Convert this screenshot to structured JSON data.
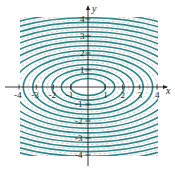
{
  "diagram": {
    "type": "contour-plot",
    "x_axis_label": "x",
    "y_axis_label": "y",
    "x_ticks": [
      "-4",
      "-3",
      "-2",
      "-1",
      "1",
      "2",
      "3",
      "4"
    ],
    "y_ticks": [
      "4",
      "3",
      "2",
      "1",
      "-1",
      "-2",
      "-3",
      "-4"
    ],
    "colors": {
      "primary_curve": "#2e8a8a",
      "secondary_curve": "#b8c8cc",
      "tertiary_curve": "#e0b8c0",
      "axis": "#222222"
    },
    "xlim": [
      -4,
      4
    ],
    "ylim": [
      -4,
      4
    ],
    "ellipse_ratio": "x-radius = 2 × y-radius"
  }
}
